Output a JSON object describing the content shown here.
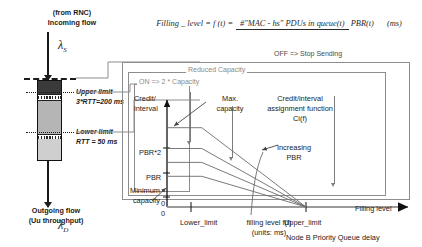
{
  "formula": {
    "lhs": "Filling _ level = f (t) =",
    "numerator": "#\"MAC - hs\" PDUs in queue(t)",
    "denominator": "PBR(t)",
    "unit": "(ms)"
  },
  "buffer": {
    "incoming_label": "(from RNC)\nIncoming flow",
    "incoming_symbol": "λ",
    "incoming_subscript": "S",
    "outgoing_label": "Outgoing flow\n(Uu throughput)",
    "outgoing_symbol": "λ",
    "outgoing_subscript": "D",
    "upper_limit_label": "Upper limit\n3*RTT=200 ms",
    "lower_limit_label": "Lower limit\nRTT = 50 ms"
  },
  "states": {
    "off": "OFF => Stop Sending",
    "reduced": "Reduced Capacity",
    "on": "ON => 2 * Capacity"
  },
  "chart_data": {
    "type": "line",
    "title": "Credit/interval assignment function Ci(f)",
    "xlabel": "filling level f(t)\n(units: ms)",
    "xlabel_secondary": "Node B Priority Queue delay",
    "xaxis_arrow_label": "Filling level",
    "ylabel": "Credit/\ninterval",
    "xticks": [
      {
        "value": 0,
        "label": "0"
      },
      {
        "value": 1,
        "label": "Lower_limit"
      },
      {
        "value": 4,
        "label": "Upper_limit"
      }
    ],
    "yticks": [
      {
        "value": 0,
        "label": "0"
      },
      {
        "value": 1,
        "label": "Minimum capacity"
      },
      {
        "value": 2,
        "label": "PBR"
      },
      {
        "value": 4,
        "label": "PBR*2"
      }
    ],
    "xlim": [
      0,
      5
    ],
    "ylim": [
      0,
      5.4
    ],
    "grid": false,
    "annotations": [
      {
        "text": "Max. capacity",
        "target": "top-curve-plateau"
      },
      {
        "text": "Increasing\nPBR",
        "target": "curve-family"
      }
    ],
    "series": [
      {
        "name": "Ci f1 (max capacity)",
        "plateau_y": 4.0,
        "knee_x": 1.0,
        "end_x": 4.0,
        "end_y": 0
      },
      {
        "name": "Ci f2",
        "plateau_y": 2.95,
        "knee_x": 1.0,
        "end_x": 4.0,
        "end_y": 0
      },
      {
        "name": "Ci f3",
        "plateau_y": 2.25,
        "knee_x": 1.0,
        "end_x": 4.0,
        "end_y": 0
      },
      {
        "name": "Ci f4 (minimum)",
        "plateau_y": 1.55,
        "knee_x": 1.0,
        "end_x": 4.0,
        "end_y": 0
      }
    ]
  }
}
